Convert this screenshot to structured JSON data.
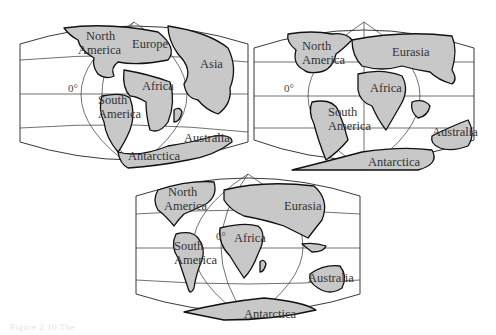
{
  "figure": {
    "caption": "Figure 2.10  The"
  },
  "maps": [
    {
      "id": "map-1",
      "era": "early",
      "equator_label": "0°",
      "labels": {
        "north_america_1": "North",
        "north_america_2": "America",
        "europe": "Europe",
        "asia": "Asia",
        "africa": "Africa",
        "south_america_1": "South",
        "south_america_2": "America",
        "australia": "Australia",
        "antarctica": "Antarctica"
      }
    },
    {
      "id": "map-2",
      "era": "middle",
      "equator_label": "0°",
      "labels": {
        "north_america_1": "North",
        "north_america_2": "America",
        "eurasia": "Eurasia",
        "africa": "Africa",
        "south_america_1": "South",
        "south_america_2": "America",
        "australia": "Australia",
        "antarctica": "Antarctica"
      }
    },
    {
      "id": "map-3",
      "era": "present",
      "equator_label": "0°",
      "labels": {
        "north_america_1": "North",
        "north_america_2": "America",
        "eurasia": "Eurasia",
        "africa": "Africa",
        "south_america_1": "South",
        "south_america_2": "America",
        "australia": "Australia",
        "antarctica": "Antarctica"
      }
    }
  ]
}
